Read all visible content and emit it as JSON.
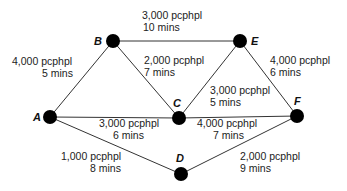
{
  "diagram": {
    "type": "network",
    "nodes": [
      {
        "id": "A",
        "label": "A",
        "x": 50,
        "y": 117
      },
      {
        "id": "B",
        "label": "B",
        "x": 113,
        "y": 41
      },
      {
        "id": "C",
        "label": "C",
        "x": 179,
        "y": 118
      },
      {
        "id": "D",
        "label": "D",
        "x": 181,
        "y": 174
      },
      {
        "id": "E",
        "label": "E",
        "x": 240,
        "y": 41
      },
      {
        "id": "F",
        "label": "F",
        "x": 297,
        "y": 116
      }
    ],
    "edges": [
      {
        "from": "A",
        "to": "B",
        "capacity": "4,000 pcphpl",
        "time": "5 mins"
      },
      {
        "from": "B",
        "to": "E",
        "capacity": "3,000 pcphpl",
        "time": "10 mins"
      },
      {
        "from": "B",
        "to": "C",
        "capacity": "2,000 pcphpl",
        "time": "7 mins"
      },
      {
        "from": "E",
        "to": "C",
        "capacity": "3,000 pcphpl",
        "time": "5 mins"
      },
      {
        "from": "E",
        "to": "F",
        "capacity": "4,000 pcphpl",
        "time": "6 mins"
      },
      {
        "from": "A",
        "to": "C",
        "capacity": "3,000 pcphpl",
        "time": "6 mins"
      },
      {
        "from": "C",
        "to": "F",
        "capacity": "4,000 pcphpl",
        "time": "7 mins"
      },
      {
        "from": "A",
        "to": "D",
        "capacity": "1,000 pcphpl",
        "time": "8 mins"
      },
      {
        "from": "D",
        "to": "F",
        "capacity": "2,000 pcphpl",
        "time": "9 mins"
      }
    ]
  }
}
